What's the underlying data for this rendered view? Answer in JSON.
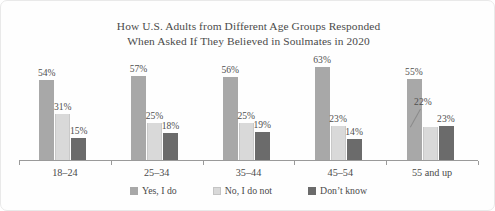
{
  "chart_data": {
    "type": "bar",
    "title": "How U.S. Adults from Different Age Groups Responded When Asked If They Believed in Soulmates in 2020",
    "title_lines": [
      "How U.S. Adults from Different Age Groups Responded",
      "When Asked If They Believed in Soulmates in 2020"
    ],
    "xlabel": "",
    "ylabel": "",
    "ylim": [
      0,
      70
    ],
    "grid": false,
    "legend_position": "bottom",
    "value_suffix": "%",
    "categories": [
      "18–24",
      "25–34",
      "35–44",
      "45–54",
      "55 and up"
    ],
    "series": [
      {
        "name": "Yes, I do",
        "color": "#a8a8a8",
        "values": [
          54,
          57,
          56,
          63,
          55
        ],
        "labels": [
          "54%",
          "57%",
          "56%",
          "63%",
          "55%"
        ]
      },
      {
        "name": "No, I do not",
        "color": "#d9d9d9",
        "values": [
          31,
          25,
          25,
          23,
          22
        ],
        "labels": [
          "31%",
          "25%",
          "25%",
          "23%",
          "22%"
        ]
      },
      {
        "name": "Don't know",
        "color": "#6b6b6b",
        "values": [
          15,
          18,
          19,
          14,
          23
        ],
        "labels": [
          "15%",
          "18%",
          "19%",
          "14%",
          "23%"
        ]
      }
    ]
  },
  "legend": {
    "items": [
      {
        "label": "Yes, I do"
      },
      {
        "label": "No, I do not"
      },
      {
        "label": "Don’t know"
      }
    ]
  }
}
